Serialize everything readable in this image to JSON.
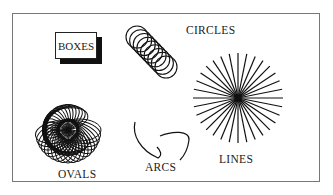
{
  "labels": {
    "boxes": "BOXES",
    "circles": "CIRCLES",
    "ovals": "OVALS",
    "arcs": "ARCS",
    "lines": "LINES"
  },
  "shapes": {
    "circles": {
      "count": 9
    },
    "ovals": {
      "count": 18
    },
    "lines": {
      "count": 32
    }
  },
  "colors": {
    "ink": "#111111",
    "frame": "#777777",
    "background": "#ffffff"
  }
}
